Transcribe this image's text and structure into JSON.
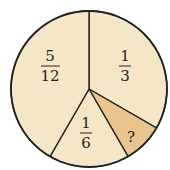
{
  "diagram": {
    "type": "pie",
    "fill_colors": {
      "default": "#f5e6c8",
      "highlight": "#e9c48c"
    },
    "stroke_color": "#222222",
    "slices": [
      {
        "name": "one-third",
        "num": "1",
        "den": "3",
        "start_deg": 0,
        "end_deg": 120,
        "highlight": false
      },
      {
        "name": "unknown",
        "label": "?",
        "start_deg": 120,
        "end_deg": 150,
        "highlight": true
      },
      {
        "name": "one-sixth",
        "num": "1",
        "den": "6",
        "start_deg": 150,
        "end_deg": 210,
        "highlight": false
      },
      {
        "name": "five-twelfths",
        "num": "5",
        "den": "12",
        "start_deg": 210,
        "end_deg": 360,
        "highlight": false
      }
    ]
  }
}
